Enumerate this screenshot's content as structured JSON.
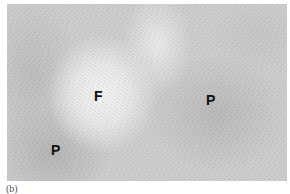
{
  "figure": {
    "labels": [
      {
        "text": "F"
      },
      {
        "text": "P"
      },
      {
        "text": "P"
      }
    ],
    "caption": "(b)"
  }
}
